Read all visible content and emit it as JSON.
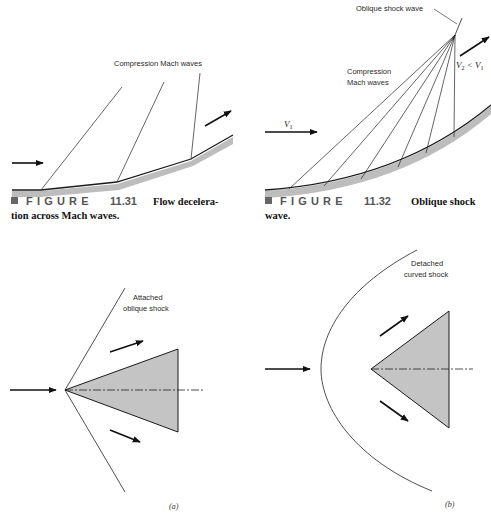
{
  "figure_11_31": {
    "label": "Compression Mach waves",
    "caption": {
      "marker": "■",
      "figure_word": "FIGURE",
      "number": "11.31",
      "text_line1": "Flow decelera-",
      "text_line2": "tion across Mach waves."
    }
  },
  "figure_11_32": {
    "shock_label": "Oblique shock wave",
    "mach_label_line1": "Compression",
    "mach_label_line2": "Mach waves",
    "v1_label": "V",
    "v1_sub": "1",
    "v2_label_a": "V",
    "v2_sub": "2",
    "v2_label_lt": " < V",
    "v2_label_sub1": "1",
    "caption": {
      "marker": "■",
      "figure_word": "FIGURE",
      "number": "11.32",
      "text_line1": "Oblique shock",
      "text_line2": "wave."
    }
  },
  "panel_a": {
    "label_line1": "Attached",
    "label_line2": "oblique shock",
    "panel_tag": "(a)"
  },
  "panel_b": {
    "label_line1": "Detached",
    "label_line2": "curved shock",
    "panel_tag": "(b)"
  },
  "colors": {
    "line": "#1a1a1a",
    "wall_shadow": "#bdbdbd",
    "cone_fill": "#c4c4c4",
    "caption_gray": "#555555"
  }
}
